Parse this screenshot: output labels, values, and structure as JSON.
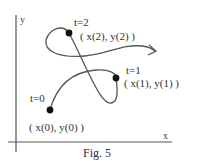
{
  "figure": {
    "caption": "Fig. 5",
    "axes": {
      "x_label": "x",
      "y_label": "y"
    },
    "points": [
      {
        "id": "t0",
        "param_label": "t=0",
        "coord_label": "( x(0), y(0) )"
      },
      {
        "id": "t1",
        "param_label": "t=1",
        "coord_label": "( x(1), y(1) )"
      },
      {
        "id": "t2",
        "param_label": "t=2",
        "coord_label": "( x(2), y(2) )"
      }
    ],
    "curve": {
      "description": "parametric curve with direction arrow",
      "color": "#555555"
    },
    "point_color": "#111111",
    "axis_color": "#555555"
  }
}
